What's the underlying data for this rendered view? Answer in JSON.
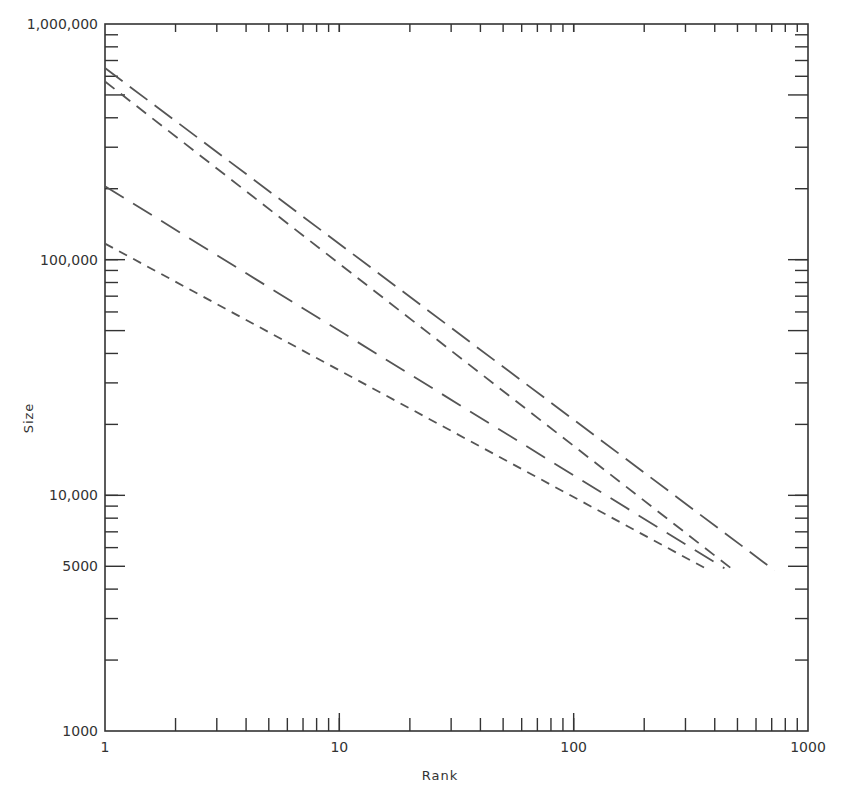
{
  "chart_data": {
    "type": "line",
    "title": "",
    "xlabel": "Rank",
    "ylabel": "Size",
    "xscale": "log",
    "yscale": "log",
    "xlim": [
      1,
      1000
    ],
    "ylim": [
      1000,
      1000000
    ],
    "x_tick_labels": [
      "1",
      "10",
      "100",
      "1000"
    ],
    "y_tick_labels": [
      "1000",
      "5000",
      "10,000",
      "100,000",
      "1,000,000"
    ],
    "grid": false,
    "legend": null,
    "series": [
      {
        "name": "series-1",
        "style": "long-dash",
        "x": [
          1,
          720
        ],
        "y": [
          650000,
          4800
        ]
      },
      {
        "name": "series-2",
        "style": "medium-dash",
        "x": [
          1,
          470
        ],
        "y": [
          570000,
          4900
        ]
      },
      {
        "name": "series-3",
        "style": "long-dash-wide",
        "x": [
          1,
          440
        ],
        "y": [
          205000,
          4900
        ]
      },
      {
        "name": "series-4",
        "style": "short-dash",
        "x": [
          1,
          365
        ],
        "y": [
          117000,
          4900
        ]
      }
    ]
  },
  "axes": {
    "x_title": "Rank",
    "y_title": "Size",
    "x_labels": [
      {
        "value": 1,
        "text": "1"
      },
      {
        "value": 10,
        "text": "10"
      },
      {
        "value": 100,
        "text": "100"
      },
      {
        "value": 1000,
        "text": "1000"
      }
    ],
    "y_labels": [
      {
        "value": 1000,
        "text": "1000"
      },
      {
        "value": 5000,
        "text": "5000"
      },
      {
        "value": 10000,
        "text": "10,000"
      },
      {
        "value": 100000,
        "text": "100,000"
      },
      {
        "value": 1000000,
        "text": "1,000,000"
      }
    ]
  },
  "colors": {
    "axis": "#333333",
    "line": "#555555",
    "background": "#ffffff"
  }
}
